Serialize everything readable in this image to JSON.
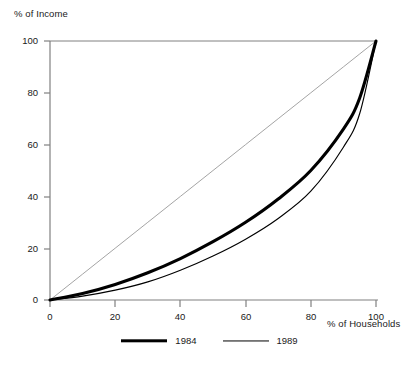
{
  "chart_data": {
    "type": "line",
    "title": "",
    "subtitle": "",
    "xlabel": "% of Households",
    "ylabel": "% of Income",
    "xlim": [
      0,
      100
    ],
    "ylim": [
      0,
      100
    ],
    "grid": false,
    "legend_position": "bottom-center",
    "x_ticks": [
      "0",
      "20",
      "40",
      "60",
      "80",
      "100"
    ],
    "y_ticks": [
      "0",
      "20",
      "40",
      "60",
      "80",
      "100"
    ],
    "x": [
      0,
      10,
      20,
      30,
      40,
      50,
      60,
      70,
      80,
      90,
      95,
      100
    ],
    "series": [
      {
        "name": "line-of-equality",
        "label": "",
        "style": "thin-gray",
        "in_legend": false,
        "values": [
          0,
          10,
          20,
          30,
          40,
          50,
          60,
          70,
          80,
          90,
          95,
          100
        ]
      },
      {
        "name": "1984",
        "label": "1984",
        "style": "thick-black",
        "in_legend": true,
        "values": [
          0,
          2.5,
          6,
          10.5,
          16,
          22.5,
          30,
          39,
          50,
          66,
          78,
          100
        ]
      },
      {
        "name": "1989",
        "label": "1989",
        "style": "thin-black",
        "in_legend": true,
        "values": [
          0,
          1.5,
          3.8,
          7,
          11.5,
          17,
          23.5,
          31.5,
          42,
          59,
          72,
          100
        ]
      }
    ],
    "annotations": []
  },
  "axes": {
    "y_title": "% of Income",
    "x_title": "% of Households",
    "y_tick_labels": [
      "100",
      "80",
      "60",
      "40",
      "20",
      "0"
    ],
    "x_tick_labels": [
      "0",
      "20",
      "40",
      "60",
      "80",
      "100"
    ]
  },
  "legend": {
    "entries": [
      {
        "label": "1984",
        "swatch": "thick-line-swatch"
      },
      {
        "label": "1989",
        "swatch": "thin-line-swatch"
      }
    ]
  },
  "colors": {
    "background": "#ffffff",
    "axis": "#808080",
    "curve_primary": "#000000",
    "curve_secondary": "#000000",
    "equality_line": "#9a9a9a",
    "text": "#1a1a1a"
  }
}
